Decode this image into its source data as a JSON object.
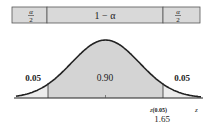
{
  "top_bar": {
    "left_cell": {
      "numerator": "α",
      "denominator": "2"
    },
    "middle_cell": "1 − α",
    "right_cell": {
      "numerator": "α",
      "denominator": "2"
    }
  },
  "regions": {
    "left_tail": "0.05",
    "center": "0.90",
    "right_tail": "0.05"
  },
  "axis": {
    "label": "z",
    "critical_label": "z(0.05)",
    "critical_label_main": "z",
    "critical_label_sub": "(0.05)",
    "critical_value": "1.65"
  },
  "colors": {
    "shade": "#d4d4d4",
    "curve": "#222222",
    "bar_fill": "#d9d9d9"
  }
}
